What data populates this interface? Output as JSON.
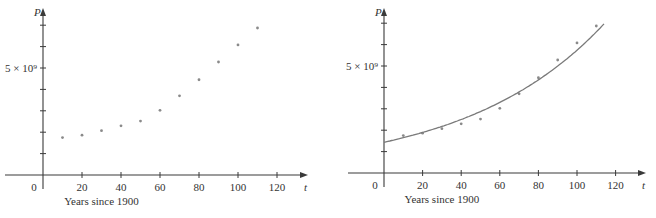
{
  "chart_data": [
    {
      "type": "scatter",
      "panel": "left",
      "title": "",
      "xlabel": "Years since 1900",
      "ylabel": "P",
      "x_axis_symbol": "t",
      "xlim": [
        -10,
        130
      ],
      "ylim": [
        0,
        7300000000.0
      ],
      "x_ticks": [
        0,
        20,
        40,
        60,
        80,
        100,
        120
      ],
      "x_tick_labels": [
        "0",
        "20",
        "40",
        "60",
        "80",
        "100",
        "120"
      ],
      "y_ticks": [
        1000000000.0,
        2000000000.0,
        3000000000.0,
        4000000000.0,
        5000000000.0,
        6000000000.0,
        7000000000.0
      ],
      "y_tick_labels": [
        "",
        "",
        "",
        "",
        "5 × 10⁹",
        "",
        ""
      ],
      "grid": false,
      "series": [
        {
          "name": "World population",
          "x": [
            10,
            20,
            30,
            40,
            50,
            60,
            70,
            80,
            90,
            100,
            110
          ],
          "y": [
            1750000000.0,
            1860000000.0,
            2070000000.0,
            2300000000.0,
            2520000000.0,
            3020000000.0,
            3700000000.0,
            4450000000.0,
            5280000000.0,
            6080000000.0,
            6870000000.0
          ]
        }
      ]
    },
    {
      "type": "scatter",
      "panel": "right",
      "title": "",
      "xlabel": "Years since 1900",
      "ylabel": "P",
      "x_axis_symbol": "t",
      "xlim": [
        -10,
        130
      ],
      "ylim": [
        0,
        7300000000.0
      ],
      "x_ticks": [
        0,
        20,
        40,
        60,
        80,
        100,
        120
      ],
      "x_tick_labels": [
        "0",
        "20",
        "40",
        "60",
        "80",
        "100",
        "120"
      ],
      "y_ticks": [
        1000000000.0,
        2000000000.0,
        3000000000.0,
        4000000000.0,
        5000000000.0,
        6000000000.0,
        7000000000.0
      ],
      "y_tick_labels": [
        "",
        "",
        "",
        "",
        "5 × 10⁹",
        "",
        ""
      ],
      "grid": false,
      "series": [
        {
          "name": "World population",
          "x": [
            10,
            20,
            30,
            40,
            50,
            60,
            70,
            80,
            90,
            100,
            110
          ],
          "y": [
            1750000000.0,
            1860000000.0,
            2070000000.0,
            2300000000.0,
            2520000000.0,
            3020000000.0,
            3700000000.0,
            4450000000.0,
            5280000000.0,
            6080000000.0,
            6870000000.0
          ]
        },
        {
          "name": "Exponential model",
          "kind": "line",
          "formula": "P = a·b^t",
          "a": 1436200000.0,
          "b": 1.01395,
          "t_range": [
            0,
            114
          ]
        }
      ]
    }
  ],
  "labels": {
    "y_symbol": "P",
    "x_symbol": "t",
    "y_mark": "5 × 10⁹",
    "x_caption": "Years since 1900",
    "origin": "0"
  }
}
